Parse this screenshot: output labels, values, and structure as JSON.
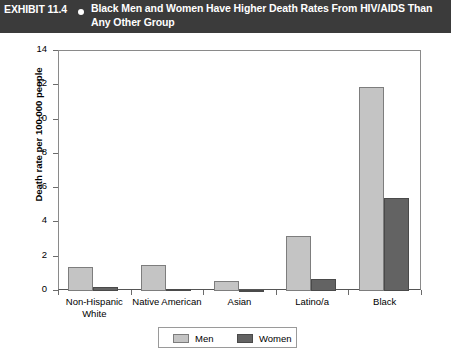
{
  "header": {
    "exhibit_label": "EXHIBIT 11.4",
    "bullet_icon": "bullet-dot-icon",
    "title": "Black Men and Women Have Higher Death Rates From HIV/AIDS Than Any Other Group",
    "background_color": "#3b3b3b",
    "text_color": "#ffffff"
  },
  "chart_data": {
    "type": "bar",
    "title": "Black Men and Women Have Higher Death Rates From HIV/AIDS Than Any Other Group",
    "categories": [
      "Non-Hispanic White",
      "Native American",
      "Asian",
      "Latino/a",
      "Black"
    ],
    "series": [
      {
        "name": "Men",
        "color": "#c4c4c4",
        "values": [
          1.4,
          1.5,
          0.6,
          3.2,
          11.9
        ]
      },
      {
        "name": "Women",
        "color": "#636363",
        "values": [
          0.25,
          0.1,
          0.07,
          0.7,
          5.4
        ]
      }
    ],
    "xlabel": "",
    "ylabel": "Death rate per 100,000 people",
    "ylim": [
      0,
      14
    ],
    "yticks": [
      0,
      2,
      4,
      6,
      8,
      10,
      12,
      14
    ],
    "ytick_labels": [
      "0",
      "2",
      "4",
      "6",
      "8",
      "10",
      "12",
      "14"
    ],
    "grid": false,
    "legend_position": "bottom-center"
  },
  "legend": {
    "items": [
      {
        "label": "Men",
        "swatch": "men"
      },
      {
        "label": "Women",
        "swatch": "women"
      }
    ]
  }
}
